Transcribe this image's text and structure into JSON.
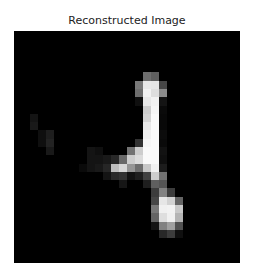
{
  "figure": {
    "title": "Reconstructed Image"
  },
  "image": {
    "width": 28,
    "height": 28,
    "colormap": "gray",
    "background_color": "#000000",
    "pixels": [
      [
        0,
        0,
        0,
        0,
        0,
        0,
        0,
        0,
        0,
        0,
        0,
        0,
        0,
        0,
        0,
        0,
        0,
        0,
        0,
        0,
        0,
        0,
        0,
        0,
        0,
        0,
        0,
        0
      ],
      [
        0,
        0,
        0,
        0,
        0,
        0,
        0,
        0,
        0,
        0,
        0,
        0,
        0,
        0,
        0,
        0,
        0,
        0,
        0,
        0,
        0,
        0,
        0,
        0,
        0,
        0,
        0,
        0
      ],
      [
        0,
        0,
        0,
        0,
        0,
        0,
        0,
        0,
        0,
        0,
        0,
        0,
        0,
        0,
        0,
        0,
        0,
        0,
        0,
        0,
        0,
        0,
        0,
        0,
        0,
        0,
        0,
        0
      ],
      [
        0,
        0,
        0,
        0,
        0,
        0,
        0,
        0,
        0,
        0,
        0,
        0,
        0,
        0,
        0,
        0,
        0,
        0,
        0,
        0,
        0,
        0,
        0,
        0,
        0,
        0,
        0,
        0
      ],
      [
        0,
        0,
        0,
        0,
        0,
        0,
        0,
        0,
        0,
        0,
        0,
        0,
        0,
        0,
        0,
        0,
        0,
        0,
        0,
        0,
        0,
        0,
        0,
        0,
        0,
        0,
        0,
        0
      ],
      [
        0,
        0,
        0,
        0,
        0,
        0,
        0,
        0,
        0,
        0,
        0,
        0,
        0,
        0,
        0,
        0,
        110,
        95,
        0,
        0,
        0,
        0,
        0,
        0,
        0,
        0,
        0,
        0
      ],
      [
        0,
        0,
        0,
        0,
        0,
        0,
        0,
        0,
        0,
        0,
        0,
        0,
        0,
        0,
        0,
        120,
        232,
        230,
        70,
        0,
        0,
        0,
        0,
        0,
        0,
        0,
        0,
        0
      ],
      [
        0,
        0,
        0,
        0,
        0,
        0,
        0,
        0,
        0,
        0,
        0,
        0,
        0,
        0,
        0,
        110,
        242,
        222,
        140,
        0,
        0,
        0,
        0,
        0,
        0,
        0,
        0,
        0
      ],
      [
        0,
        0,
        0,
        0,
        0,
        0,
        0,
        0,
        0,
        0,
        0,
        0,
        0,
        0,
        0,
        15,
        232,
        242,
        20,
        0,
        0,
        0,
        0,
        0,
        0,
        0,
        0,
        0
      ],
      [
        0,
        0,
        0,
        0,
        0,
        0,
        0,
        0,
        0,
        0,
        0,
        0,
        0,
        0,
        0,
        0,
        205,
        246,
        10,
        0,
        0,
        0,
        0,
        0,
        0,
        0,
        0,
        0
      ],
      [
        0,
        0,
        20,
        0,
        0,
        0,
        0,
        0,
        0,
        0,
        0,
        0,
        0,
        0,
        0,
        0,
        212,
        250,
        8,
        0,
        0,
        0,
        0,
        0,
        0,
        0,
        0,
        0
      ],
      [
        0,
        0,
        25,
        0,
        0,
        0,
        0,
        0,
        0,
        0,
        0,
        0,
        0,
        0,
        0,
        0,
        232,
        250,
        8,
        0,
        0,
        0,
        0,
        0,
        0,
        0,
        0,
        0
      ],
      [
        0,
        0,
        0,
        15,
        30,
        0,
        0,
        0,
        0,
        0,
        0,
        0,
        0,
        0,
        0,
        0,
        240,
        250,
        12,
        0,
        0,
        0,
        0,
        0,
        0,
        0,
        0,
        0
      ],
      [
        0,
        0,
        0,
        15,
        35,
        0,
        0,
        0,
        0,
        0,
        0,
        0,
        0,
        0,
        0,
        50,
        246,
        250,
        10,
        0,
        0,
        0,
        0,
        0,
        0,
        0,
        0,
        0
      ],
      [
        0,
        0,
        0,
        0,
        25,
        0,
        0,
        0,
        0,
        20,
        15,
        0,
        0,
        0,
        115,
        205,
        250,
        250,
        18,
        0,
        0,
        0,
        0,
        0,
        0,
        0,
        0,
        0
      ],
      [
        0,
        0,
        0,
        0,
        0,
        0,
        0,
        0,
        0,
        20,
        20,
        25,
        40,
        105,
        205,
        220,
        250,
        250,
        15,
        0,
        0,
        0,
        0,
        0,
        0,
        0,
        0,
        0
      ],
      [
        0,
        0,
        0,
        0,
        0,
        0,
        0,
        0,
        10,
        20,
        25,
        38,
        190,
        215,
        150,
        110,
        200,
        242,
        28,
        0,
        0,
        0,
        0,
        0,
        0,
        0,
        0,
        0
      ],
      [
        0,
        0,
        0,
        0,
        0,
        0,
        0,
        0,
        0,
        0,
        0,
        20,
        42,
        50,
        18,
        30,
        65,
        205,
        115,
        0,
        0,
        0,
        0,
        0,
        0,
        0,
        0,
        0
      ],
      [
        0,
        0,
        0,
        0,
        0,
        0,
        0,
        0,
        0,
        0,
        0,
        0,
        0,
        22,
        0,
        0,
        30,
        95,
        85,
        0,
        0,
        0,
        0,
        0,
        0,
        0,
        0,
        0
      ],
      [
        0,
        0,
        0,
        0,
        0,
        0,
        0,
        0,
        0,
        0,
        0,
        0,
        0,
        0,
        0,
        0,
        0,
        60,
        130,
        60,
        0,
        0,
        0,
        0,
        0,
        0,
        0,
        0
      ],
      [
        0,
        0,
        0,
        0,
        0,
        0,
        0,
        0,
        0,
        0,
        0,
        0,
        0,
        0,
        0,
        0,
        0,
        70,
        230,
        210,
        100,
        0,
        0,
        0,
        0,
        0,
        0,
        0
      ],
      [
        0,
        0,
        0,
        0,
        0,
        0,
        0,
        0,
        0,
        0,
        0,
        0,
        0,
        0,
        0,
        0,
        0,
        120,
        240,
        242,
        200,
        0,
        0,
        0,
        0,
        0,
        0,
        0
      ],
      [
        0,
        0,
        0,
        0,
        0,
        0,
        0,
        0,
        0,
        0,
        0,
        0,
        0,
        0,
        0,
        0,
        0,
        100,
        222,
        240,
        180,
        0,
        0,
        0,
        0,
        0,
        0,
        0
      ],
      [
        0,
        0,
        0,
        0,
        0,
        0,
        0,
        0,
        0,
        0,
        0,
        0,
        0,
        0,
        0,
        0,
        0,
        20,
        130,
        160,
        80,
        0,
        0,
        0,
        0,
        0,
        0,
        0
      ],
      [
        0,
        0,
        0,
        0,
        0,
        0,
        0,
        0,
        0,
        0,
        0,
        0,
        0,
        0,
        0,
        0,
        0,
        0,
        40,
        60,
        15,
        0,
        0,
        0,
        0,
        0,
        0,
        0
      ],
      [
        0,
        0,
        0,
        0,
        0,
        0,
        0,
        0,
        0,
        0,
        0,
        0,
        0,
        0,
        0,
        0,
        0,
        0,
        0,
        0,
        0,
        0,
        0,
        0,
        0,
        0,
        0,
        0
      ],
      [
        0,
        0,
        0,
        0,
        0,
        0,
        0,
        0,
        0,
        0,
        0,
        0,
        0,
        0,
        0,
        0,
        0,
        0,
        0,
        0,
        0,
        0,
        0,
        0,
        0,
        0,
        0,
        0
      ],
      [
        0,
        0,
        0,
        0,
        0,
        0,
        0,
        0,
        0,
        0,
        0,
        0,
        0,
        0,
        0,
        0,
        0,
        0,
        0,
        0,
        0,
        0,
        0,
        0,
        0,
        0,
        0,
        0
      ]
    ]
  }
}
